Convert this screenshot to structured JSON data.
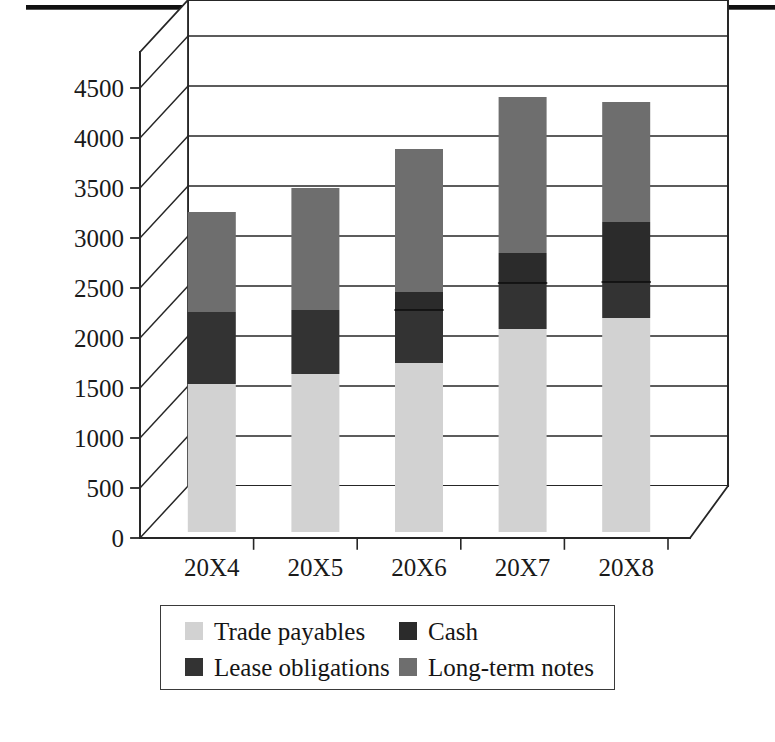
{
  "figure": {
    "has_top_rule": true,
    "background": "#ffffff"
  },
  "chart_data": {
    "type": "bar",
    "subtype": "stacked-column-3d",
    "title": "",
    "xlabel": "",
    "ylabel": "",
    "categories": [
      "20X4",
      "20X5",
      "20X6",
      "20X7",
      "20X8"
    ],
    "ylim": [
      0,
      4500
    ],
    "yticks": [
      0,
      500,
      1000,
      1500,
      2000,
      2500,
      3000,
      3500,
      4000,
      4500
    ],
    "ytick_labels": [
      "0",
      "500",
      "1000",
      "1500",
      "2000",
      "2500",
      "3000",
      "3500",
      "4000",
      "4500"
    ],
    "grid": true,
    "legend_position": "bottom",
    "stack_order": [
      "Trade payables",
      "Lease obligations",
      "Cash",
      "Long-term notes"
    ],
    "series": [
      {
        "name": "Trade payables",
        "color": "#d2d2d2",
        "values": [
          1480,
          1580,
          1690,
          2030,
          2140
        ]
      },
      {
        "name": "Lease obligations",
        "color": "#333333",
        "values": [
          720,
          640,
          530,
          460,
          360
        ]
      },
      {
        "name": "Cash",
        "color": "#2b2b2b",
        "values": [
          0,
          0,
          180,
          300,
          600
        ]
      },
      {
        "name": "Long-term notes",
        "color": "#6e6e6e",
        "values": [
          1000,
          1220,
          1430,
          1560,
          1200
        ]
      }
    ],
    "totals": [
      3200,
      3440,
      3830,
      4350,
      4300
    ]
  },
  "legend": {
    "rows": [
      [
        {
          "label": "Trade payables",
          "color": "#d2d2d2"
        },
        {
          "label": "Cash",
          "color": "#2b2b2b"
        }
      ],
      [
        {
          "label": "Lease obligations",
          "color": "#333333"
        },
        {
          "label": "Long-term notes",
          "color": "#6e6e6e"
        }
      ]
    ]
  }
}
